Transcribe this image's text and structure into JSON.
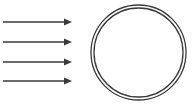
{
  "figure": {
    "canvas": {
      "width": 192,
      "height": 108,
      "background": "#ffffff"
    },
    "stroke_color": "#3a3a3a",
    "arrow_color": "#3a3a3a",
    "circle_color": "#3a3a3a",
    "rays": {
      "label": "parallel incident rays",
      "count": 4,
      "direction": "right",
      "line_width": 1.4,
      "head_length": 8,
      "head_width": 7,
      "items": [
        {
          "name": "ray-1",
          "x_start": 3,
          "x_end": 72,
          "y": 22
        },
        {
          "name": "ray-2",
          "x_start": 3,
          "x_end": 72,
          "y": 42
        },
        {
          "name": "ray-3",
          "x_start": 3,
          "x_end": 72,
          "y": 62
        },
        {
          "name": "ray-4",
          "x_start": 3,
          "x_end": 72,
          "y": 81
        }
      ]
    },
    "circle": {
      "label": "double circle outline",
      "center_x": 138.5,
      "center_y": 52.5,
      "outer_radius": 47.5,
      "inner_radius": 44.5,
      "line_width": 1.3,
      "fill": "none"
    }
  }
}
